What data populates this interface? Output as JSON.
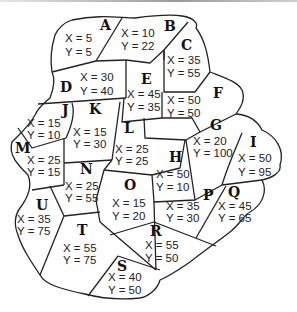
{
  "diagram": {
    "type": "region map",
    "regions": [
      {
        "id": "A",
        "x": "X = 5",
        "y": "Y = 5"
      },
      {
        "id": "B",
        "x": "X = 10",
        "y": "Y = 22"
      },
      {
        "id": "C",
        "x": "X = 35",
        "y": "Y = 55"
      },
      {
        "id": "D",
        "x": "X = 30",
        "y": "Y = 40"
      },
      {
        "id": "E",
        "x": "X = 45",
        "y": "Y = 35"
      },
      {
        "id": "F",
        "x": "X = 50",
        "y": "Y = 50"
      },
      {
        "id": "G",
        "x": "X = 20",
        "y": "Y = 100"
      },
      {
        "id": "H",
        "x": "X = 50",
        "y": "Y = 10"
      },
      {
        "id": "I",
        "x": "X = 50",
        "y": "Y = 95"
      },
      {
        "id": "J",
        "x": "X = 15",
        "y": "Y = 10"
      },
      {
        "id": "K",
        "x": "X = 15",
        "y": "Y = 30"
      },
      {
        "id": "L",
        "x": "X = 25",
        "y": "Y = 25"
      },
      {
        "id": "M",
        "x": "X = 25",
        "y": "Y = 15"
      },
      {
        "id": "N",
        "x": "X = 25",
        "y": "Y = 55"
      },
      {
        "id": "O",
        "x": "X = 15",
        "y": "Y = 20"
      },
      {
        "id": "P",
        "x": "X = 35",
        "y": "Y = 30"
      },
      {
        "id": "Q",
        "x": "X = 45",
        "y": "Y = 65"
      },
      {
        "id": "R",
        "x": "X = 55",
        "y": "Y = 50"
      },
      {
        "id": "S",
        "x": "X = 40",
        "y": "Y = 50"
      },
      {
        "id": "T",
        "x": "X = 55",
        "y": "Y = 75"
      },
      {
        "id": "U",
        "x": "X = 35",
        "y": "Y = 75"
      }
    ]
  }
}
